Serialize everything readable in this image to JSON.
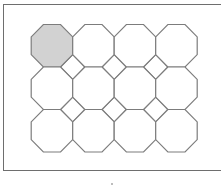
{
  "diagram": {
    "grid": {
      "columns": 4,
      "rows": 3
    },
    "highlighted_tiles": [
      {
        "row": 0,
        "col": 0
      }
    ],
    "colors": {
      "stroke": "#7c7c7c",
      "highlight_fill": "#d2d2d2",
      "tile_fill": "#ffffff",
      "frame": "#6e6e6e"
    }
  }
}
